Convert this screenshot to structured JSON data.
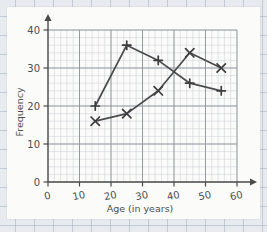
{
  "chart_data": {
    "type": "line",
    "title": "",
    "xlabel": "Age (in years)",
    "ylabel": "Frequency",
    "xlim": [
      0,
      60
    ],
    "ylim": [
      0,
      40
    ],
    "xticks": [
      0,
      10,
      20,
      30,
      40,
      50,
      60
    ],
    "yticks": [
      0,
      10,
      20,
      30,
      40
    ],
    "xtick_labels": [
      "0",
      "10",
      "20",
      "30",
      "40",
      "50",
      "60"
    ],
    "ytick_labels": [
      "0",
      "10",
      "20",
      "30",
      "40"
    ],
    "grid": "graph-paper minor squares with major gridlines every 10 units",
    "legend": "none",
    "x": [
      15,
      25,
      35,
      45,
      55
    ],
    "series": [
      {
        "name": "series-plus",
        "marker": "plus",
        "color": "#4b4b4d",
        "values": [
          20,
          36,
          32,
          26,
          24
        ]
      },
      {
        "name": "series-cross",
        "marker": "cross",
        "color": "#4b4b4d",
        "values": [
          16,
          18,
          24,
          34,
          30
        ]
      }
    ]
  },
  "axes": {
    "x_title": "Age (in years)",
    "y_title": "Frequency"
  }
}
